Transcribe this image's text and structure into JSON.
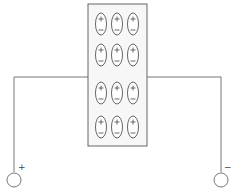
{
  "diagram": {
    "dielectric": {
      "rows": 4,
      "cols": 3,
      "dipole_orientation": "positive-top"
    },
    "terminals": [
      {
        "id": "left",
        "polarity": "+",
        "label": "+"
      },
      {
        "id": "right",
        "polarity": "-",
        "label": "−"
      }
    ],
    "colors": {
      "line": "#777777",
      "box_fill": "#f7f7f7",
      "background": "#ffffff"
    }
  }
}
